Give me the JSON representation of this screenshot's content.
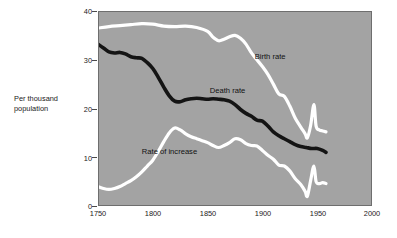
{
  "figure": {
    "background_color": "#ffffff",
    "plot_background_color": "#a3a3a3",
    "frame_color": "#6e6e6e"
  },
  "axes": {
    "y_axis_title_line1": "Per thousand",
    "y_axis_title_line2": "population",
    "y_ticks": [
      "0",
      "10",
      "20",
      "30",
      "40"
    ],
    "x_ticks": [
      "1750",
      "1800",
      "1850",
      "1900",
      "1950",
      "2000"
    ]
  },
  "legend": {
    "birth_rate_label": "Birth rate",
    "death_rate_label": "Death rate",
    "rate_of_increase_label": "Rate of increase"
  },
  "chart_data": {
    "type": "line",
    "title": "",
    "xlabel": "",
    "ylabel": "Per thousand population",
    "xlim": [
      1750,
      2000
    ],
    "ylim": [
      0,
      40
    ],
    "xticks": [
      1750,
      1800,
      1850,
      1900,
      1950,
      2000
    ],
    "yticks": [
      0,
      10,
      20,
      30,
      40
    ],
    "grid": false,
    "legend_position": "inline-annotations",
    "series": [
      {
        "name": "Birth rate",
        "color": "#ffffff",
        "label_x": 1893,
        "label_y": 30.6,
        "x": [
          1750,
          1760,
          1770,
          1780,
          1790,
          1800,
          1810,
          1820,
          1830,
          1840,
          1850,
          1855,
          1860,
          1865,
          1870,
          1875,
          1880,
          1885,
          1890,
          1895,
          1900,
          1905,
          1910,
          1915,
          1920,
          1925,
          1930,
          1935,
          1939,
          1941,
          1944,
          1947,
          1949,
          1952,
          1955,
          1958
        ],
        "y": [
          36.5,
          36.8,
          37.0,
          37.2,
          37.4,
          37.3,
          36.9,
          36.8,
          36.9,
          36.6,
          35.8,
          34.6,
          33.9,
          34.2,
          34.7,
          35.0,
          34.4,
          33.2,
          31.4,
          30.0,
          28.6,
          27.0,
          25.0,
          23.0,
          22.5,
          20.5,
          18.0,
          16.2,
          14.8,
          14.0,
          16.5,
          20.8,
          16.4,
          15.6,
          15.4,
          15.2
        ]
      },
      {
        "name": "Death rate",
        "color": "#141414",
        "label_x": 1852,
        "label_y": 23.6,
        "x": [
          1750,
          1755,
          1760,
          1765,
          1770,
          1775,
          1780,
          1785,
          1790,
          1795,
          1800,
          1805,
          1810,
          1815,
          1820,
          1825,
          1830,
          1835,
          1840,
          1845,
          1850,
          1855,
          1860,
          1865,
          1870,
          1875,
          1880,
          1885,
          1890,
          1895,
          1900,
          1905,
          1910,
          1915,
          1920,
          1925,
          1930,
          1935,
          1940,
          1945,
          1950,
          1955,
          1958
        ],
        "y": [
          33.2,
          32.4,
          31.6,
          31.4,
          31.5,
          31.2,
          30.6,
          30.4,
          30.3,
          29.4,
          28.2,
          26.4,
          24.4,
          22.6,
          21.5,
          21.4,
          21.8,
          22.0,
          22.1,
          22.0,
          21.9,
          22.0,
          21.9,
          21.8,
          21.5,
          20.8,
          19.8,
          19.0,
          18.4,
          17.6,
          17.4,
          16.4,
          15.2,
          14.4,
          13.8,
          13.2,
          12.6,
          12.2,
          12.0,
          11.8,
          11.8,
          11.4,
          11.0
        ]
      },
      {
        "name": "Rate of increase",
        "color": "#ffffff",
        "label_x": 1790,
        "label_y": 11.0,
        "x": [
          1750,
          1755,
          1760,
          1765,
          1770,
          1775,
          1780,
          1785,
          1790,
          1795,
          1800,
          1805,
          1810,
          1815,
          1820,
          1825,
          1830,
          1835,
          1840,
          1845,
          1850,
          1855,
          1860,
          1865,
          1870,
          1875,
          1880,
          1885,
          1890,
          1895,
          1900,
          1905,
          1910,
          1915,
          1920,
          1925,
          1930,
          1935,
          1939,
          1941,
          1944,
          1947,
          1949,
          1952,
          1955,
          1958
        ],
        "y": [
          4.0,
          3.6,
          3.4,
          3.6,
          4.0,
          4.6,
          5.2,
          6.0,
          7.0,
          8.2,
          9.4,
          11.2,
          13.2,
          15.0,
          16.0,
          15.6,
          14.8,
          14.2,
          13.8,
          13.4,
          13.0,
          12.4,
          12.0,
          12.4,
          13.0,
          13.8,
          13.6,
          12.8,
          12.4,
          12.3,
          11.4,
          10.4,
          9.6,
          8.4,
          8.2,
          7.2,
          5.6,
          4.4,
          3.0,
          2.0,
          5.2,
          8.2,
          5.0,
          4.6,
          4.8,
          4.6
        ]
      }
    ]
  }
}
